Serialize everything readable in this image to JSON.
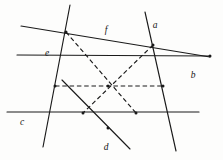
{
  "figure": {
    "background_color": "#fdfdfc",
    "ink_color": "#1a1a1a",
    "width": 223,
    "height": 160,
    "labels": [
      {
        "id": "label-a",
        "text": "a",
        "x": 155,
        "y": 28
      },
      {
        "id": "label-b",
        "text": "b",
        "x": 193,
        "y": 78
      },
      {
        "id": "label-c",
        "text": "c",
        "x": 22,
        "y": 125
      },
      {
        "id": "label-d",
        "text": "d",
        "x": 106,
        "y": 150
      },
      {
        "id": "label-e",
        "text": "e",
        "x": 47,
        "y": 56
      },
      {
        "id": "label-f",
        "text": "f",
        "x": 106,
        "y": 33
      }
    ],
    "solid_lines": [
      {
        "id": "line-f",
        "name": "line-f",
        "x1": 21,
        "y1": 26,
        "x2": 210,
        "y2": 57
      },
      {
        "id": "line-e",
        "name": "line-e",
        "x1": 70,
        "y1": 5,
        "x2": 43,
        "y2": 147
      },
      {
        "id": "line-a",
        "name": "line-a",
        "x1": 145,
        "y1": 12,
        "x2": 176,
        "y2": 151
      },
      {
        "id": "line-c",
        "name": "line-c",
        "x1": 7,
        "y1": 112,
        "x2": 199,
        "y2": 112
      },
      {
        "id": "line-b",
        "name": "line-b",
        "x1": 17,
        "y1": 55,
        "x2": 210,
        "y2": 56
      },
      {
        "id": "line-d",
        "name": "line-d",
        "x1": 62,
        "y1": 80,
        "x2": 130,
        "y2": 149
      }
    ],
    "dashed_lines": [
      {
        "id": "diag-tl-br",
        "name": "diagonal-topleft-bottomright",
        "x1": 66,
        "y1": 32,
        "x2": 136,
        "y2": 113
      },
      {
        "id": "diag-tr-bl",
        "name": "diagonal-topright-bottomleft",
        "x1": 153,
        "y1": 45,
        "x2": 83,
        "y2": 113
      },
      {
        "id": "diag-left-right",
        "name": "diagonal-left-right",
        "x1": 55,
        "y1": 86,
        "x2": 163,
        "y2": 86
      }
    ],
    "vertices": [
      {
        "id": "v-f-e",
        "name": "vertex-f-e",
        "x": 66,
        "y": 32
      },
      {
        "id": "v-f-a",
        "name": "vertex-f-a",
        "x": 153,
        "y": 45
      },
      {
        "id": "v-e-b",
        "name": "vertex-e-b",
        "x": 55,
        "y": 86
      },
      {
        "id": "v-a-b",
        "name": "vertex-a-b",
        "x": 163,
        "y": 86
      },
      {
        "id": "v-c-d",
        "name": "vertex-c-d",
        "x": 83,
        "y": 113
      },
      {
        "id": "v-c-a2",
        "name": "vertex-c-right",
        "x": 136,
        "y": 113
      },
      {
        "id": "v-center",
        "name": "vertex-center",
        "x": 108,
        "y": 86
      },
      {
        "id": "v-d-b",
        "name": "vertex-d-b",
        "x": 108,
        "y": 128
      },
      {
        "id": "v-f-b",
        "name": "vertex-f-b",
        "x": 210,
        "y": 56
      }
    ]
  }
}
